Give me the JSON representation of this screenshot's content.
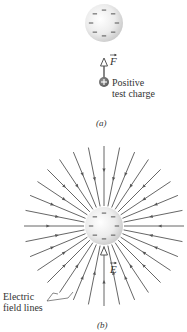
{
  "panel_a": {
    "caption": "(a)",
    "sphere": {
      "cx": 104,
      "cy": 23,
      "r": 19,
      "charge_sign": "−",
      "charge_count": 8
    },
    "force_label": "F",
    "test_charge_label_line1": "Positive",
    "test_charge_label_line2": "test charge",
    "test_charge_sign": "+"
  },
  "panel_b": {
    "caption": "(b)",
    "sphere": {
      "cx": 104,
      "cy": 226,
      "r": 19,
      "charge_sign": "−",
      "charge_count": 8
    },
    "field_label": "E",
    "field_lines_label_line1": "Electric",
    "field_lines_label_line2": "field lines",
    "field_line_count": 32,
    "field_line_outer_radius": 80,
    "field_direction": "inward"
  },
  "colors": {
    "line": "#555555",
    "arrow": "#555555",
    "sphere_light": "#fafafa",
    "sphere_dark": "#cfcfcf",
    "text": "#333333"
  }
}
